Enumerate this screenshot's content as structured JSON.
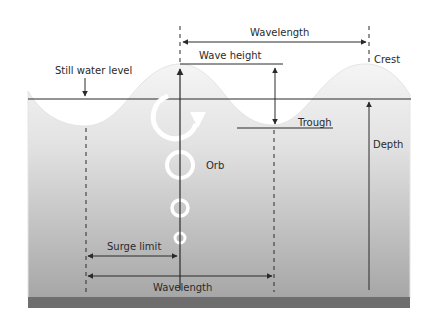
{
  "diagram": {
    "labels": {
      "wavelength_top": "Wavelength",
      "wave_height": "Wave height",
      "crest": "Crest",
      "still_water_level": "Still water level",
      "trough": "Trough",
      "depth": "Depth",
      "orb": "Orb",
      "surge_limit": "Surge limit",
      "wavelength_bottom": "Wavelength"
    },
    "colors": {
      "water_top": "#f3f3f3",
      "water_bottom": "#a8a8a8",
      "seabed": "#6e6e6e",
      "line": "#2a2a2a",
      "orbit": "#ffffff",
      "background": "#ffffff"
    },
    "orbits": [
      {
        "name": "surface-orbit",
        "r": 22
      },
      {
        "name": "orbit-large",
        "r": 13
      },
      {
        "name": "orbit-medium",
        "r": 8
      },
      {
        "name": "orbit-small",
        "r": 5
      }
    ]
  }
}
